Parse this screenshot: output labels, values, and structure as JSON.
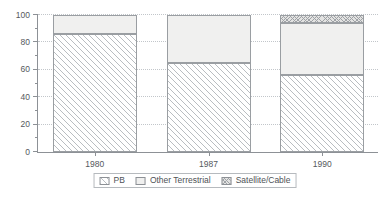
{
  "chart_data": {
    "type": "bar",
    "stacked": true,
    "title": "",
    "subtitle": "",
    "xlabel": "",
    "ylabel": "",
    "categories": [
      "1980",
      "1987",
      "1990"
    ],
    "series": [
      {
        "name": "PB",
        "values": [
          86,
          65,
          56
        ],
        "pattern": "diagonal-hatch"
      },
      {
        "name": "Other Terrestrial",
        "values": [
          14,
          35,
          38
        ],
        "pattern": "solid-light"
      },
      {
        "name": "Satellite/Cable",
        "values": [
          0,
          0,
          6
        ],
        "pattern": "cross-hatch"
      }
    ],
    "ylim": [
      0,
      100
    ],
    "yticks": [
      0,
      20,
      40,
      60,
      80,
      100
    ],
    "yticklabels": [
      "0",
      "20",
      "40",
      "60",
      "80",
      "100"
    ],
    "yminorticks": [
      10,
      30,
      50,
      70,
      90
    ],
    "grid": true,
    "grid_axis": "y",
    "legend_position": "bottom-center",
    "legend_entries": [
      "PB",
      "Other Terrestrial",
      "Satellite/Cable"
    ],
    "colors": {
      "axis": "#8d9196",
      "grid": "#c2c6ca",
      "bar_border": "#9a9ea2",
      "pb_hatch": "#b9bdc1",
      "other_fill": "#f0f0ef",
      "sat_fill": "#e3e3e2",
      "text": "#55595d",
      "background": "#ffffff"
    }
  },
  "axes": {
    "y": {
      "ticks": [
        {
          "value": 100,
          "label": "100"
        },
        {
          "value": 80,
          "label": "80"
        },
        {
          "value": 60,
          "label": "60"
        },
        {
          "value": 40,
          "label": "40"
        },
        {
          "value": 20,
          "label": "20"
        },
        {
          "value": 0,
          "label": "0"
        }
      ],
      "minor": [
        90,
        70,
        50,
        30,
        10
      ]
    },
    "x": {
      "ticks": [
        {
          "label": "1980"
        },
        {
          "label": "1987"
        },
        {
          "label": "1990"
        }
      ]
    }
  },
  "legend": {
    "items": [
      {
        "label": "PB"
      },
      {
        "label": "Other Terrestrial"
      },
      {
        "label": "Satellite/Cable"
      }
    ]
  }
}
